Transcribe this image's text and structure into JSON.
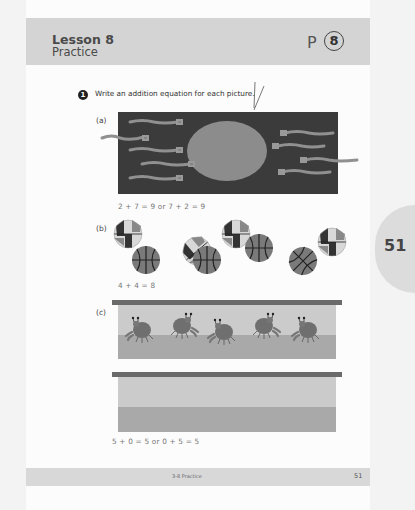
{
  "header": {
    "lesson_title": "Lesson 8",
    "lesson_subtitle": "Practice",
    "p_label": "P",
    "p_number": "8"
  },
  "question": {
    "number": "1",
    "prompt": "Write an addition equation for each picture."
  },
  "parts": [
    {
      "label": "(a)",
      "picture": "5 sperm-like swimmers on left, 4 on right, large oval center",
      "answer": "2 + 7 = 9 or 7 + 2 = 9"
    },
    {
      "label": "(b)",
      "picture": "4 beach balls and 4 basketballs",
      "answer": "4 + 4 = 8"
    },
    {
      "label": "(c)",
      "picture": "Two tanks: one with 5 crabs, one empty",
      "answer": "5 + 0 = 5 or 0 + 5 = 5"
    }
  ],
  "footer": {
    "section": "3-8 Practice",
    "page_number": "51"
  },
  "side_tab": {
    "page_number": "51"
  },
  "colors": {
    "header_bg": "#d4d4d4",
    "dark_panel": "#3a3a3a",
    "oval": "#8c8c8c",
    "swimmer": "#8f8f8f",
    "tank_top": "#c9c9c9",
    "tank_bottom": "#a9a9a9",
    "tank_rim": "#6a6a6a"
  }
}
